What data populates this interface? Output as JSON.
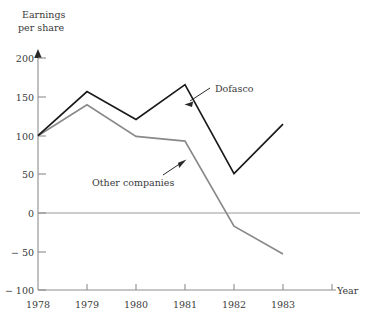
{
  "chart_data": {
    "type": "line",
    "title": "",
    "ylabel": "Earnings\nper share",
    "ylabel_line1": "Earnings",
    "ylabel_line2": "per share",
    "xlabel": "Year",
    "categories": [
      "1978",
      "1979",
      "1980",
      "1981",
      "1982",
      "1983"
    ],
    "x": [
      1978,
      1979,
      1980,
      1981,
      1982,
      1983
    ],
    "ylim": [
      -100,
      200
    ],
    "yticks": [
      200,
      150,
      100,
      50,
      0,
      -50,
      -100
    ],
    "ytick_labels": [
      "200",
      "150",
      "100",
      "50",
      "0",
      "− 50",
      "− 100"
    ],
    "grid": false,
    "legend": "annotations",
    "series": [
      {
        "name": "Dofasco",
        "color": "#1a1a1a",
        "values": [
          100,
          157,
          121,
          166,
          51,
          115
        ]
      },
      {
        "name": "Other companies",
        "color": "#8a8a8a",
        "values": [
          100,
          140,
          99,
          93,
          -17,
          -53
        ]
      }
    ],
    "annotations": [
      {
        "text": "Dofasco",
        "series": "Dofasco",
        "points_to_x": 1981
      },
      {
        "text": "Other companies",
        "series": "Other companies",
        "points_to_x": 1981
      }
    ]
  }
}
